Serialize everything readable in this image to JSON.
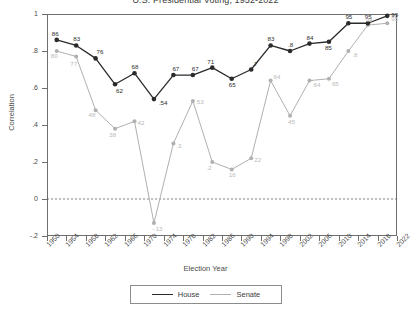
{
  "title": "U.S. Presidential Voting, 1952-2022",
  "axes": {
    "ylabel": "Correlation",
    "xlabel": "Election Year",
    "yticks": [
      "1",
      ".8",
      ".6",
      ".4",
      ".2",
      "0",
      "-.2"
    ],
    "ytick_values": [
      1,
      0.8,
      0.6,
      0.4,
      0.2,
      0,
      -0.2
    ],
    "xticks": [
      "1950",
      "1954",
      "1958",
      "1962",
      "1966",
      "1970",
      "1974",
      "1978",
      "1982",
      "1986",
      "1990",
      "1994",
      "1998",
      "2002",
      "2006",
      "2010",
      "2014",
      "2018",
      "2022"
    ]
  },
  "legend": {
    "house_label": "House",
    "senate_label": "Senate",
    "house_color": "#2b2b2b",
    "senate_color": "#b0b0b0"
  },
  "chart_data": {
    "type": "line",
    "title": "U.S. Presidential Voting, 1952-2022",
    "xlabel": "Election Year",
    "ylabel": "Correlation",
    "xlim": [
      1950,
      2022
    ],
    "ylim": [
      -0.2,
      1.0
    ],
    "grid": false,
    "zero_line": true,
    "legend_position": "bottom",
    "x": [
      1952,
      1956,
      1960,
      1964,
      1968,
      1972,
      1976,
      1980,
      1984,
      1988,
      1992,
      1996,
      2000,
      2004,
      2008,
      2012,
      2016,
      2020
    ],
    "series": [
      {
        "name": "House",
        "color": "#2b2b2b",
        "values": [
          0.86,
          0.83,
          0.76,
          0.62,
          0.68,
          0.54,
          0.67,
          0.67,
          0.71,
          0.65,
          0.7,
          0.83,
          0.8,
          0.84,
          0.85,
          0.95,
          0.95,
          0.99
        ],
        "labels": [
          "86",
          "83",
          "76",
          "62",
          "68",
          ".54",
          "67",
          "67",
          "71",
          "65",
          ".7",
          "83",
          ".8",
          "84",
          "85",
          "95",
          "95",
          "99"
        ]
      },
      {
        "name": "Senate",
        "color": "#b0b0b0",
        "values": [
          0.8,
          0.77,
          0.48,
          0.38,
          0.42,
          -0.13,
          0.3,
          0.53,
          0.2,
          0.16,
          0.22,
          0.64,
          0.45,
          0.64,
          0.65,
          0.8,
          0.94,
          0.95
        ],
        "labels": [
          "80",
          "77",
          "48",
          "38",
          "42",
          "-.13",
          ".3",
          "53",
          ".2",
          "16",
          "22",
          "64",
          "45",
          "64",
          "65",
          ".8",
          "94",
          "95"
        ]
      }
    ]
  }
}
